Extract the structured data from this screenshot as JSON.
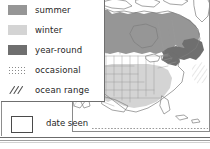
{
  "map": {
    "title": "North America range map",
    "region": "North America",
    "projection_note": "continental outline with state and province boundaries",
    "shading": {
      "summer_color": "#969696",
      "winter_color": "#d4d4d4",
      "year_round_color": "#6f6f6f",
      "occasional_color": "#8a8a8a",
      "ocean_range_color": "#7a7a7a",
      "land_outline_color": "#7d7d7d",
      "background_color": "#ffffff"
    },
    "regions": [
      {
        "name": "canada-boreal-summer",
        "category": "summer"
      },
      {
        "name": "alaska-summer",
        "category": "summer"
      },
      {
        "name": "southeast-us-winter",
        "category": "winter"
      },
      {
        "name": "great-lakes-northeast-year-round",
        "category": "year-round"
      }
    ]
  },
  "legend": {
    "items": [
      {
        "swatch": "summer-swatch",
        "label": "summer",
        "pattern": "solid",
        "color": "#969696"
      },
      {
        "swatch": "winter-swatch",
        "label": "winter",
        "pattern": "solid",
        "color": "#d4d4d4"
      },
      {
        "swatch": "year-round-swatch",
        "label": "year-round",
        "pattern": "solid",
        "color": "#6f6f6f"
      },
      {
        "swatch": "occasional-swatch",
        "label": "occasional",
        "pattern": "dotted",
        "color": "#8a8a8a"
      },
      {
        "swatch": "ocean-range-swatch",
        "label": "ocean range",
        "pattern": "diagonal-hatch",
        "color": "#6f6f6f"
      }
    ]
  },
  "date_seen": {
    "label": "date seen",
    "value": "",
    "placeholder": ""
  }
}
